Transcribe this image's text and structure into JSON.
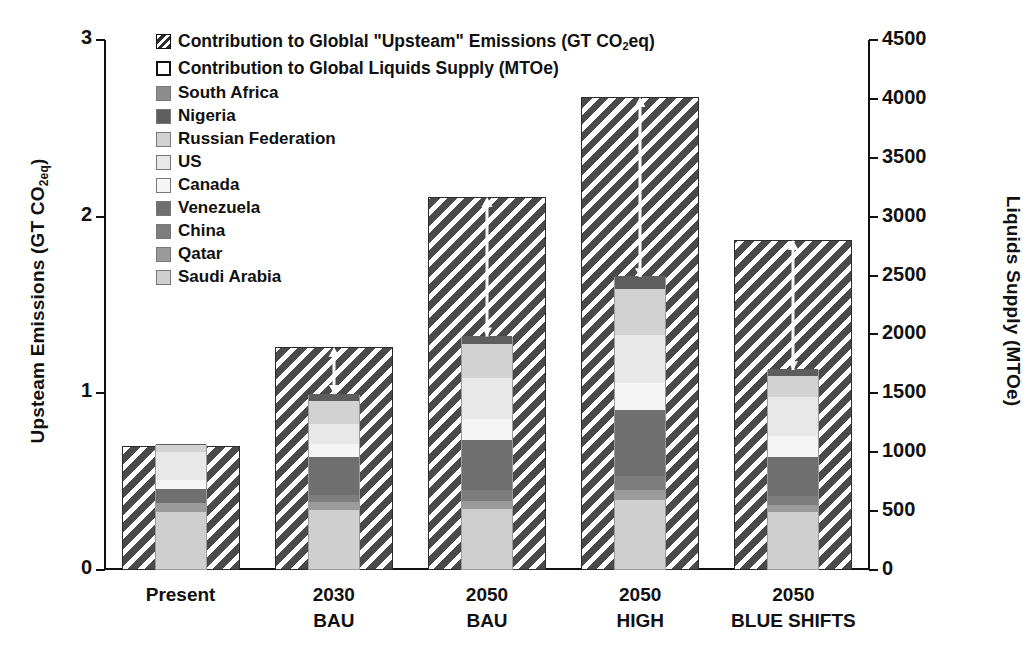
{
  "chart_data": {
    "type": "bar",
    "title": "",
    "subtitle": "",
    "categories": [
      "Present",
      "2030 BAU",
      "2050 BAU",
      "2050 HIGH",
      "2050 BLUE SHIFTS"
    ],
    "category_lines": [
      [
        "Present",
        ""
      ],
      [
        "2030",
        "BAU"
      ],
      [
        "2050",
        "BAU"
      ],
      [
        "2050",
        "HIGH"
      ],
      [
        "2050",
        "BLUE SHIFTS"
      ]
    ],
    "left_axis": {
      "label": "Upsteam Emissions (GT CO",
      "label_sub": "2eq",
      "label_tail": ")",
      "ticks": [
        "0",
        "1",
        "2",
        "3"
      ],
      "tick_values": [
        0,
        1,
        2,
        3
      ],
      "min": 0,
      "max": 3
    },
    "right_axis": {
      "label": "Liquids Supply (MTOe)",
      "ticks": [
        "0",
        "500",
        "1000",
        "1500",
        "2000",
        "2500",
        "3000",
        "3500",
        "4000",
        "4500"
      ],
      "tick_values": [
        0,
        500,
        1000,
        1500,
        2000,
        2500,
        3000,
        3500,
        4000,
        4500
      ],
      "min": 0,
      "max": 4500
    },
    "grid": false,
    "legend_position": "top-left",
    "series": [
      {
        "name": "Contribution to Globlal \"Upsteam\" Emissions (GT CO2eq)",
        "axis": "left",
        "pattern": "hatched",
        "values": [
          0.7,
          1.26,
          2.11,
          2.68,
          1.87
        ]
      },
      {
        "name": "Contribution to Global Liquids Supply (MTOe)",
        "axis": "right",
        "pattern": "stacked",
        "stack_order_bottom_up": [
          "Saudi Arabia",
          "Qatar",
          "China",
          "Venezuela",
          "Canada",
          "US",
          "Russian Federation",
          "Nigeria",
          "South Africa"
        ],
        "totals": [
          1060,
          1490,
          1980,
          2490,
          1700
        ],
        "stacks": [
          {
            "category": "Present",
            "values": [
              480,
              80,
              0,
              120,
              80,
              230,
              60,
              10,
              0
            ]
          },
          {
            "category": "2030 BAU",
            "values": [
              500,
              70,
              55,
              330,
              105,
              170,
              200,
              60,
              0
            ]
          },
          {
            "category": "2050 BAU",
            "values": [
              510,
              70,
              95,
              420,
              180,
              350,
              290,
              65,
              0
            ]
          },
          {
            "category": "2050 HIGH",
            "values": [
              590,
              80,
              120,
              560,
              230,
              410,
              390,
              110,
              0
            ]
          },
          {
            "category": "2050 BLUE SHIFTS",
            "values": [
              480,
              60,
              80,
              330,
              180,
              330,
              180,
              60,
              0
            ]
          }
        ]
      }
    ],
    "annotations": {
      "arrows": "white up-arrows from top of inner liquids stack to top of hatched emissions bar"
    }
  },
  "legend": {
    "top_items": [
      {
        "label_pre": "Contribution to Globlal \"Upsteam\" Emissions (GT CO",
        "label_sub": "2",
        "label_post": "eq)",
        "swatch": "hatched-swatch"
      },
      {
        "label_pre": "Contribution to Global Liquids Supply (MTOe)",
        "label_sub": "",
        "label_post": "",
        "swatch": "hollow-swatch"
      }
    ],
    "country_items": [
      {
        "label": "South Africa",
        "color": "#8d8d8d"
      },
      {
        "label": "Nigeria",
        "color": "#5e5e5e"
      },
      {
        "label": "Russian Federation",
        "color": "#d2d2d2"
      },
      {
        "label": "US",
        "color": "#e8e8e8"
      },
      {
        "label": "Canada",
        "color": "#f5f5f5"
      },
      {
        "label": "Venezuela",
        "color": "#6f6f6f"
      },
      {
        "label": "China",
        "color": "#7d7d7d"
      },
      {
        "label": "Qatar",
        "color": "#9b9b9b"
      },
      {
        "label": "Saudi Arabia",
        "color": "#cfcfcf"
      }
    ]
  },
  "colors": {
    "hatch": "#4a4a4a",
    "axis": "#111111",
    "background": "#ffffff",
    "arrow": "#ffffff"
  }
}
